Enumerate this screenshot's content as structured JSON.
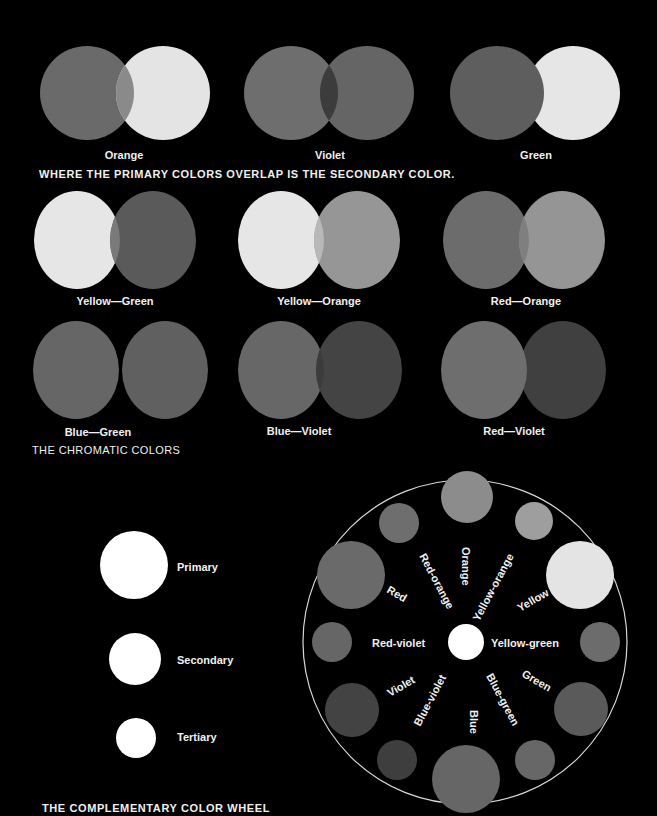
{
  "secondary": {
    "caption": "WHERE THE PRIMARY COLORS OVERLAP IS THE SECONDARY COLOR.",
    "pairs": [
      {
        "label": "Orange",
        "left": "#6a6a6a",
        "right": "#e4e4e4",
        "overlap": "#8a8a8a"
      },
      {
        "label": "Violet",
        "left": "#6e6e6e",
        "right": "#656565",
        "overlap": "#3c3c3c"
      },
      {
        "label": "Green",
        "left": "#5e5e5e",
        "right": "#e6e6e6",
        "overlap": "#5e5e5e"
      }
    ]
  },
  "chromatic": {
    "caption": "THE CHROMATIC COLORS",
    "pairs": [
      {
        "label": "Yellow—Green",
        "left": "#e6e6e6",
        "right": "#5a5a5a",
        "overlap": "#7a7a7a"
      },
      {
        "label": "Yellow—Orange",
        "left": "#e6e6e6",
        "right": "#969696",
        "overlap": "#b8b8b8"
      },
      {
        "label": "Red—Orange",
        "left": "#6c6c6c",
        "right": "#959595",
        "overlap": "#7f7f7f"
      },
      {
        "label": "Blue—Green",
        "left": "#666666",
        "right": "#606060",
        "overlap": "#6e6e6e"
      },
      {
        "label": "Blue—Violet",
        "left": "#676767",
        "right": "#444444",
        "overlap": "#3c3c3c"
      },
      {
        "label": "Red—Violet",
        "left": "#6e6e6e",
        "right": "#404040",
        "overlap": "#747474"
      }
    ]
  },
  "legend": {
    "items": [
      {
        "label": "Primary"
      },
      {
        "label": "Secondary"
      },
      {
        "label": "Tertiary"
      }
    ]
  },
  "wheel": {
    "caption": "THE COMPLEMENTARY COLOR WHEEL",
    "center_label": "",
    "nodes": [
      {
        "name": "Orange",
        "type": "secondary",
        "shade": "#8c8c8c"
      },
      {
        "name": "Yellow-orange",
        "type": "tertiary",
        "shade": "#9e9e9e"
      },
      {
        "name": "Yellow",
        "type": "primary",
        "shade": "#e4e4e4"
      },
      {
        "name": "Yellow-green",
        "type": "tertiary",
        "shade": "#6c6c6c"
      },
      {
        "name": "Green",
        "type": "secondary",
        "shade": "#5a5a5a"
      },
      {
        "name": "Blue-green",
        "type": "tertiary",
        "shade": "#676767"
      },
      {
        "name": "Blue",
        "type": "primary",
        "shade": "#666666"
      },
      {
        "name": "Blue-violet",
        "type": "tertiary",
        "shade": "#3e3e3e"
      },
      {
        "name": "Violet",
        "type": "secondary",
        "shade": "#434343"
      },
      {
        "name": "Red-violet",
        "type": "tertiary",
        "shade": "#666666"
      },
      {
        "name": "Red",
        "type": "primary",
        "shade": "#6a6a6a"
      },
      {
        "name": "Red-orange",
        "type": "tertiary",
        "shade": "#6e6e6e"
      }
    ]
  }
}
